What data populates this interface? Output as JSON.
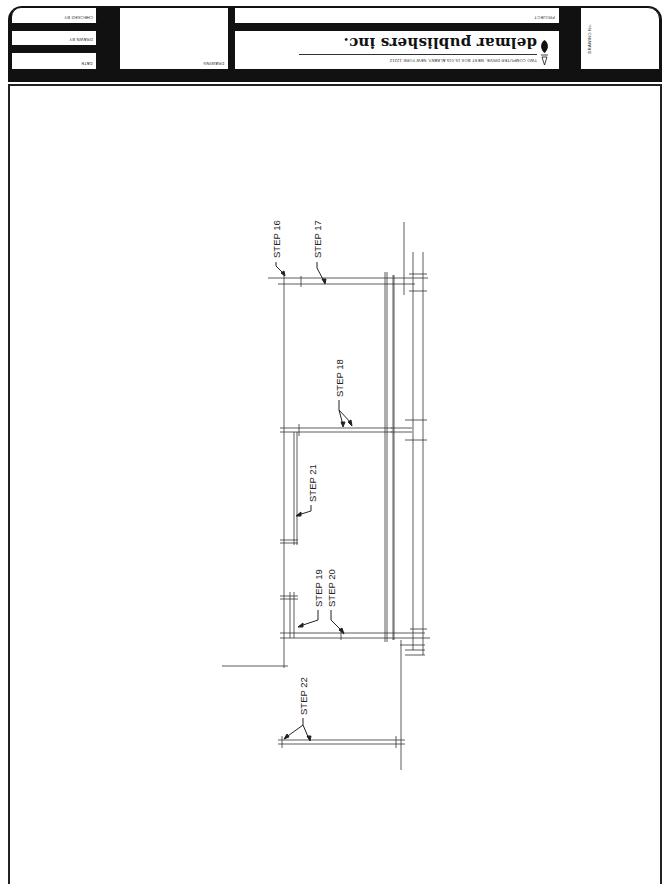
{
  "title_block": {
    "orientation": "rotated 180 degrees",
    "fields": {
      "checked_by": "CHECKED BY",
      "drawn_by": "DRAWN BY",
      "date": "DATE",
      "drawing": "DRAWING",
      "project": "PROJECT",
      "drawing_no": "DRAWING No."
    },
    "publisher": {
      "name": "delmar publishers inc.",
      "address": "TWO COMPUTER DRIVE, WEST  BOX 15-015  ALBANY, NEW YORK 12212"
    }
  },
  "drawing": {
    "callouts": [
      {
        "id": "step16",
        "label": "STEP 16"
      },
      {
        "id": "step17",
        "label": "STEP 17"
      },
      {
        "id": "step18",
        "label": "STEP 18"
      },
      {
        "id": "step19",
        "label": "STEP 19"
      },
      {
        "id": "step20",
        "label": "STEP 20"
      },
      {
        "id": "step21",
        "label": "STEP 21"
      },
      {
        "id": "step22",
        "label": "STEP 22"
      }
    ],
    "colors": {
      "ink": "#222222",
      "light_ink": "#555555",
      "paper": "#ffffff"
    }
  }
}
